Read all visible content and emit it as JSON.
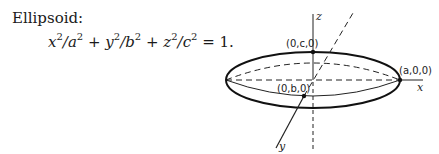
{
  "heading": "Ellipsoid:",
  "equation": {
    "t1": "x",
    "e1": "2",
    "d1": "/a",
    "e2": "2",
    "op1": " + ",
    "t2": "y",
    "e3": "2",
    "d2": "/b",
    "e4": "2",
    "op2": " + ",
    "t3": "z",
    "e5": "2",
    "d3": "/c",
    "e6": "2",
    "rhs": " = 1."
  },
  "diagram": {
    "axes": {
      "x": "x",
      "y": "y",
      "z": "z"
    },
    "points": {
      "top": "(0,c,0)",
      "right": "(a,0,0)",
      "front": "(0,b,0)"
    }
  }
}
